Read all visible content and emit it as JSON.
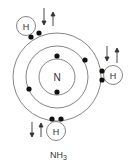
{
  "diagram": {
    "central_atom": {
      "symbol": "N"
    },
    "hydrogens": [
      {
        "symbol": "H",
        "position": "top-left"
      },
      {
        "symbol": "H",
        "position": "right"
      },
      {
        "symbol": "H",
        "position": "bottom"
      }
    ],
    "formula": {
      "base": "NH",
      "subscript": "3"
    },
    "colors": {
      "line": "#555555",
      "electron": "#111111",
      "background": "#ffffff"
    }
  }
}
